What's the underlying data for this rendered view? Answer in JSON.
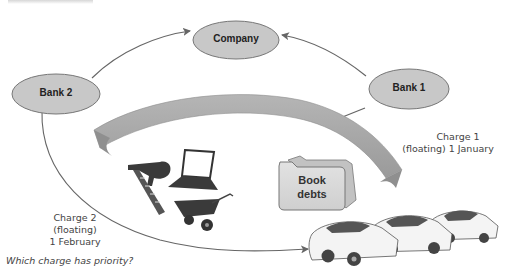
{
  "diagram": {
    "nodes": {
      "company": {
        "label": "Company"
      },
      "bank1": {
        "label": "Bank 1"
      },
      "bank2": {
        "label": "Bank 2"
      }
    },
    "assets": {
      "book_debts": {
        "line1": "Book",
        "line2": "debts"
      },
      "icons": [
        "nail-gun-icon",
        "laptop-icon",
        "wheelbarrow-icon",
        "cars-icon"
      ]
    },
    "charges": {
      "charge1": {
        "line1": "Charge 1",
        "line2": "(floating) 1 January"
      },
      "charge2": {
        "line1": "Charge 2",
        "line2": "(floating)",
        "line3": "1 February"
      }
    },
    "question": "Which charge has priority?",
    "colors": {
      "node_fill": "#c8c8c8",
      "node_stroke": "#777777",
      "band": "#a9a9a9",
      "arrow": "#666666",
      "folder": "#d6d6d6",
      "text": "#444444"
    }
  }
}
